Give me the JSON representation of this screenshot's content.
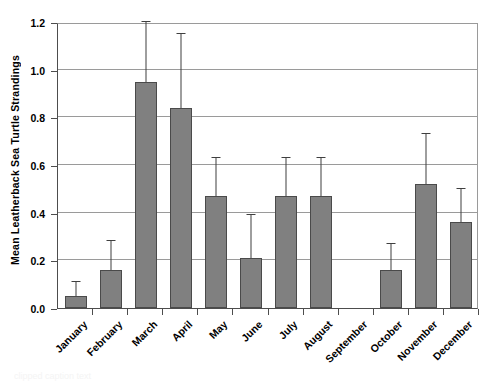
{
  "chart_data": {
    "type": "bar",
    "title": "",
    "xlabel": "",
    "ylabel": "Mean Leatherback Sea Turtle Strandings",
    "ylim": [
      0.0,
      1.2
    ],
    "yticks": [
      "0.0",
      "0.2",
      "0.4",
      "0.6",
      "0.8",
      "1.0",
      "1.2"
    ],
    "ytick_values": [
      0.0,
      0.2,
      0.4,
      0.6,
      0.8,
      1.0,
      1.2
    ],
    "grid": "horizontal",
    "legend": "none",
    "categories": [
      "January",
      "February",
      "March",
      "April",
      "May",
      "June",
      "July",
      "August",
      "September",
      "October",
      "November",
      "December"
    ],
    "values": [
      0.05,
      0.16,
      0.95,
      0.84,
      0.47,
      0.21,
      0.47,
      0.47,
      0.0,
      0.16,
      0.52,
      0.36
    ],
    "error_upper": [
      0.11,
      0.28,
      1.2,
      1.15,
      0.63,
      0.39,
      0.63,
      0.63,
      0.0,
      0.27,
      0.73,
      0.5
    ],
    "series": [
      {
        "name": "Mean Leatherback Sea Turtle Strandings",
        "values": [
          0.05,
          0.16,
          0.95,
          0.84,
          0.47,
          0.21,
          0.47,
          0.47,
          0.0,
          0.16,
          0.52,
          0.36
        ]
      }
    ],
    "bar_color": "#808080",
    "bar_edge_color": "#4a4a4a",
    "axis_color": "#4d4d4d",
    "gridline_color": "#9a9a9a"
  },
  "caption": {
    "remnant": "clipped caption text"
  }
}
